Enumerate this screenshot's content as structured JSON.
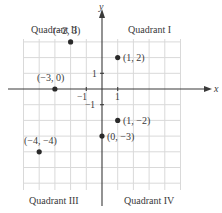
{
  "diagram": {
    "type": "coordinate-plane",
    "axes": {
      "x_label": "x",
      "y_label": "y",
      "tick_labels": {
        "x_pos": "1",
        "x_neg": "−1",
        "y_pos": "1",
        "y_neg": "−1"
      }
    },
    "quadrants": [
      {
        "name": "Quadrant I",
        "label": "Quadrant I"
      },
      {
        "name": "Quadrant II",
        "label": "Quadrant II"
      },
      {
        "name": "Quadrant III",
        "label": "Quadrant III"
      },
      {
        "name": "Quadrant IV",
        "label": "Quadrant IV"
      }
    ],
    "points": [
      {
        "x": -2,
        "y": 3,
        "label": "(−2, 3)"
      },
      {
        "x": 1,
        "y": 2,
        "label": "(1, 2)"
      },
      {
        "x": -3,
        "y": 0,
        "label": "(−3, 0)"
      },
      {
        "x": 1,
        "y": -2,
        "label": "(1, −2)"
      },
      {
        "x": 0,
        "y": -3,
        "label": "(0, −3)"
      },
      {
        "x": -4,
        "y": -4,
        "label": "(−4, −4)"
      }
    ],
    "colors": {
      "grid": "#d9d9d9",
      "axis": "#3a3a3a",
      "point": "#2a2a2a",
      "text": "#3a3a3a"
    }
  }
}
